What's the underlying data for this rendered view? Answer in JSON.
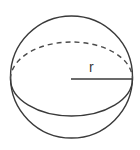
{
  "diagram": {
    "radius_label": "r",
    "stroke_color": "#3a3a3a",
    "background_color": "#ffffff",
    "parts": {
      "outer_circle": "solid",
      "equator_front": "solid",
      "equator_back": "dashed",
      "radius_segment": "solid"
    }
  }
}
